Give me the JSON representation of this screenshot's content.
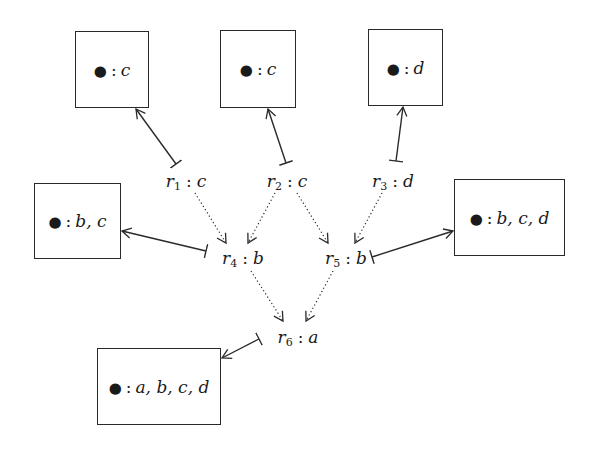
{
  "diagram": {
    "type": "dependency-graph",
    "nodes": {
      "box_c1": {
        "bullet": "●",
        "sep": ":",
        "atoms": "c",
        "x": 75,
        "y": 31,
        "w": 74,
        "h": 77
      },
      "box_c2": {
        "bullet": "●",
        "sep": ":",
        "atoms": "c",
        "x": 220,
        "y": 30,
        "w": 76,
        "h": 78
      },
      "box_d": {
        "bullet": "●",
        "sep": ":",
        "atoms": "d",
        "x": 368,
        "y": 29,
        "w": 75,
        "h": 77
      },
      "box_bc": {
        "bullet": "●",
        "sep": ":",
        "atoms": "b, c",
        "x": 34,
        "y": 183,
        "w": 87,
        "h": 76
      },
      "box_bcd": {
        "bullet": "●",
        "sep": ":",
        "atoms": "b, c, d",
        "x": 454,
        "y": 179,
        "w": 111,
        "h": 77
      },
      "box_abcd": {
        "bullet": "●",
        "sep": ":",
        "atoms": "a, b, c, d",
        "x": 97,
        "y": 348,
        "w": 124,
        "h": 77
      }
    },
    "rules": {
      "r1": {
        "name": "r",
        "sub": "1",
        "sep": ":",
        "head": "c",
        "x": 186,
        "y": 182
      },
      "r2": {
        "name": "r",
        "sub": "2",
        "sep": ":",
        "head": "c",
        "x": 287,
        "y": 182
      },
      "r3": {
        "name": "r",
        "sub": "3",
        "sep": ":",
        "head": "d",
        "x": 393,
        "y": 182
      },
      "r4": {
        "name": "r",
        "sub": "4",
        "sep": ":",
        "head": "b",
        "x": 243,
        "y": 259
      },
      "r5": {
        "name": "r",
        "sub": "5",
        "sep": ":",
        "head": "b",
        "x": 346,
        "y": 259
      },
      "r6": {
        "name": "r",
        "sub": "6",
        "sep": ":",
        "head": "a",
        "x": 298,
        "y": 338
      }
    },
    "solid_edges": [
      {
        "from": "r1",
        "to": "box_c1",
        "x1": 176,
        "y1": 164,
        "x2": 136,
        "y2": 109
      },
      {
        "from": "r2",
        "to": "box_c2",
        "x1": 286,
        "y1": 163,
        "x2": 268,
        "y2": 109
      },
      {
        "from": "r3",
        "to": "box_d",
        "x1": 396,
        "y1": 161,
        "x2": 403,
        "y2": 107
      },
      {
        "from": "r4",
        "to": "box_bc",
        "x1": 206,
        "y1": 251,
        "x2": 122,
        "y2": 231
      },
      {
        "from": "r5",
        "to": "box_bcd",
        "x1": 372,
        "y1": 257,
        "x2": 453,
        "y2": 231
      },
      {
        "from": "r6",
        "to": "box_abcd",
        "x1": 259,
        "y1": 339,
        "x2": 222,
        "y2": 358
      }
    ],
    "dotted_edges": [
      {
        "from": "r1",
        "to": "r4",
        "x1": 195,
        "y1": 193,
        "x2": 226,
        "y2": 243
      },
      {
        "from": "r2",
        "to": "r4",
        "x1": 275,
        "y1": 193,
        "x2": 248,
        "y2": 243
      },
      {
        "from": "r2",
        "to": "r5",
        "x1": 297,
        "y1": 193,
        "x2": 328,
        "y2": 243
      },
      {
        "from": "r3",
        "to": "r5",
        "x1": 382,
        "y1": 193,
        "x2": 355,
        "y2": 243
      },
      {
        "from": "r4",
        "to": "r6",
        "x1": 251,
        "y1": 271,
        "x2": 283,
        "y2": 321
      },
      {
        "from": "r5",
        "to": "r6",
        "x1": 333,
        "y1": 271,
        "x2": 306,
        "y2": 321
      }
    ],
    "colors": {
      "stroke": "#2a2a2a",
      "text": "#1a1a1a",
      "background": "#ffffff"
    }
  }
}
